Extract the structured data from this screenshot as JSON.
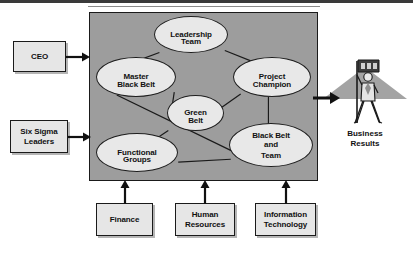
{
  "diagram": {
    "panel": {
      "fill_color": "#9d9d9d",
      "border_color": "#1a1a1a"
    },
    "nodes": [
      {
        "id": "leadership",
        "label": "Leadership Team",
        "lines": [
          "Leadership",
          "Team"
        ],
        "shape": "ellipse"
      },
      {
        "id": "master-black-belt",
        "label": "Master Black Belt",
        "lines": [
          "Master",
          "Black Belt"
        ],
        "shape": "ellipse"
      },
      {
        "id": "project-champion",
        "label": "Project Champion",
        "lines": [
          "Project",
          "Champion"
        ],
        "shape": "ellipse"
      },
      {
        "id": "green-belt",
        "label": "Green Belt",
        "lines": [
          "Green",
          "Belt"
        ],
        "shape": "ellipse"
      },
      {
        "id": "black-belt-and-team",
        "label": "Black Belt and Team",
        "lines": [
          "Black Belt",
          "and",
          "Team"
        ],
        "shape": "ellipse"
      },
      {
        "id": "functional-groups",
        "label": "Functional Groups",
        "lines": [
          "Functional",
          "Groups"
        ],
        "shape": "ellipse"
      }
    ],
    "inputs_left": [
      {
        "id": "ceo",
        "label": "CEO",
        "lines": [
          "CEO"
        ]
      },
      {
        "id": "six-sigma-leaders",
        "label": "Six Sigma Leaders",
        "lines": [
          "Six Sigma",
          "Leaders"
        ]
      }
    ],
    "inputs_bottom": [
      {
        "id": "finance",
        "label": "Finance",
        "lines": [
          "Finance"
        ]
      },
      {
        "id": "human-resources",
        "label": "Human Resources",
        "lines": [
          "Human",
          "Resources"
        ]
      },
      {
        "id": "information-technology",
        "label": "Information Technology",
        "lines": [
          "Information",
          "Technology"
        ]
      }
    ],
    "output": {
      "id": "business-results",
      "label": "Business Results",
      "lines": [
        "Business",
        "Results"
      ],
      "icon": "climber-with-flag-on-peak-icon"
    },
    "connections": [
      {
        "from": "leadership",
        "to": "master-black-belt"
      },
      {
        "from": "leadership",
        "to": "project-champion"
      },
      {
        "from": "master-black-belt",
        "to": "green-belt"
      },
      {
        "from": "master-black-belt",
        "to": "black-belt-and-team"
      },
      {
        "from": "green-belt",
        "to": "project-champion"
      },
      {
        "from": "green-belt",
        "to": "functional-groups"
      },
      {
        "from": "project-champion",
        "to": "black-belt-and-team"
      },
      {
        "from": "functional-groups",
        "to": "black-belt-and-team"
      }
    ],
    "colors": {
      "panel_gray": "#9d9d9d",
      "node_fill": "#e8e8e8",
      "box_fill": "#e6e6e6",
      "line": "#1a1a1a",
      "peak_gray": "#a0a0a0"
    }
  },
  "caption": {
    "text": ""
  }
}
